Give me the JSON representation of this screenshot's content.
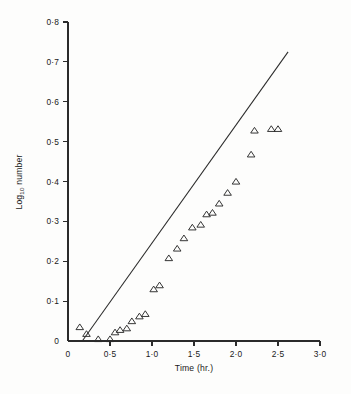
{
  "figure": {
    "background_color": "#fdfdfc",
    "ink_color": "#2b2b2b"
  },
  "chart_data": {
    "type": "scatter",
    "title": "",
    "subtitle": "",
    "xlabel": "Time (hr.)",
    "ylabel": "Log₁₀ number",
    "ylabel_main": "Log",
    "ylabel_subscript": "10",
    "ylabel_tail": " number",
    "xlim": [
      0,
      3.0
    ],
    "ylim": [
      0,
      0.8
    ],
    "grid": false,
    "legend": null,
    "legend_position": "none",
    "x_tick_values": [
      0,
      0.5,
      1.0,
      1.5,
      2.0,
      2.5,
      3.0
    ],
    "x_tick_labels": [
      "0",
      "0·5",
      "1·0",
      "1·5",
      "2·0",
      "2·5",
      "3·0"
    ],
    "y_tick_values": [
      0,
      0.1,
      0.2,
      0.3,
      0.4,
      0.5,
      0.6,
      0.7,
      0.8
    ],
    "y_tick_labels": [
      "0",
      "0·1",
      "0·2",
      "0·3",
      "0·4",
      "0·5",
      "0·6",
      "0·7",
      "0·8"
    ],
    "series": [
      {
        "name": "observed",
        "marker": "open-triangle",
        "type": "scatter",
        "points": [
          [
            0.14,
            0.035
          ],
          [
            0.22,
            0.018
          ],
          [
            0.36,
            0.005
          ],
          [
            0.5,
            0.005
          ],
          [
            0.56,
            0.022
          ],
          [
            0.62,
            0.028
          ],
          [
            0.7,
            0.032
          ],
          [
            0.76,
            0.05
          ],
          [
            0.85,
            0.062
          ],
          [
            0.92,
            0.068
          ],
          [
            1.02,
            0.13
          ],
          [
            1.09,
            0.14
          ],
          [
            1.2,
            0.208
          ],
          [
            1.3,
            0.232
          ],
          [
            1.38,
            0.258
          ],
          [
            1.48,
            0.285
          ],
          [
            1.58,
            0.292
          ],
          [
            1.65,
            0.318
          ],
          [
            1.72,
            0.322
          ],
          [
            1.8,
            0.345
          ],
          [
            1.9,
            0.372
          ],
          [
            2.0,
            0.4
          ],
          [
            2.18,
            0.468
          ],
          [
            2.22,
            0.528
          ],
          [
            2.42,
            0.532
          ],
          [
            2.5,
            0.532
          ]
        ]
      },
      {
        "name": "fitted-line",
        "marker": "none",
        "type": "line",
        "points": [
          [
            0.17,
            0.0
          ],
          [
            2.62,
            0.725
          ]
        ]
      }
    ]
  }
}
